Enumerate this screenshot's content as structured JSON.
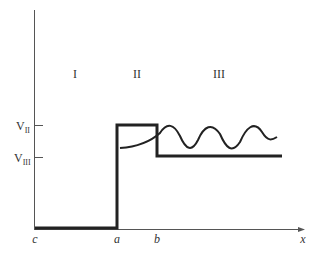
{
  "diagram": {
    "type": "potential-step-barrier",
    "region_labels": [
      "I",
      "II",
      "III"
    ],
    "level_labels": {
      "v2": {
        "base": "V",
        "sub": "II"
      },
      "v3": {
        "base": "V",
        "sub": "III"
      }
    },
    "x_labels": [
      "c",
      "a",
      "b"
    ],
    "axis_label": "x",
    "colors": {
      "line": "#222222",
      "axis": "#555555",
      "text": "#333333"
    }
  }
}
